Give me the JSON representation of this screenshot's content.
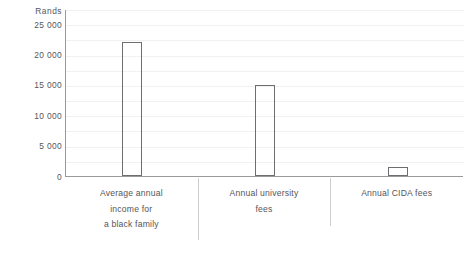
{
  "chart_data": {
    "type": "bar",
    "title": "",
    "subtitle": "",
    "xlabel": "",
    "ylabel": "Rands",
    "ylim": [
      0,
      27500
    ],
    "grid": true,
    "legend": null,
    "orientation": "vertical",
    "bar_style": "outlined",
    "categories": [
      "Average annual income for a black family",
      "Annual university fees",
      "Annual CIDA fees"
    ],
    "category_lines": [
      [
        "Average annual",
        "income for",
        "a black family"
      ],
      [
        "Annual university",
        "fees"
      ],
      [
        "Annual CIDA fees"
      ]
    ],
    "values": [
      22000,
      15000,
      1500
    ],
    "ytick_values": [
      0,
      5000,
      10000,
      15000,
      20000,
      25000
    ],
    "ytick_labels": [
      "0",
      "5 000",
      "10 000",
      "15 000",
      "20 000",
      "25 000"
    ],
    "unit_label": "Rands",
    "colors": {
      "bar_stroke": "#6e6e72",
      "bar_fill": "none",
      "axis": "#9a9a9a",
      "gridline": "#f1f1f1",
      "text": "#55555a",
      "separator": "#cfcfd2",
      "background": "#ffffff"
    }
  }
}
